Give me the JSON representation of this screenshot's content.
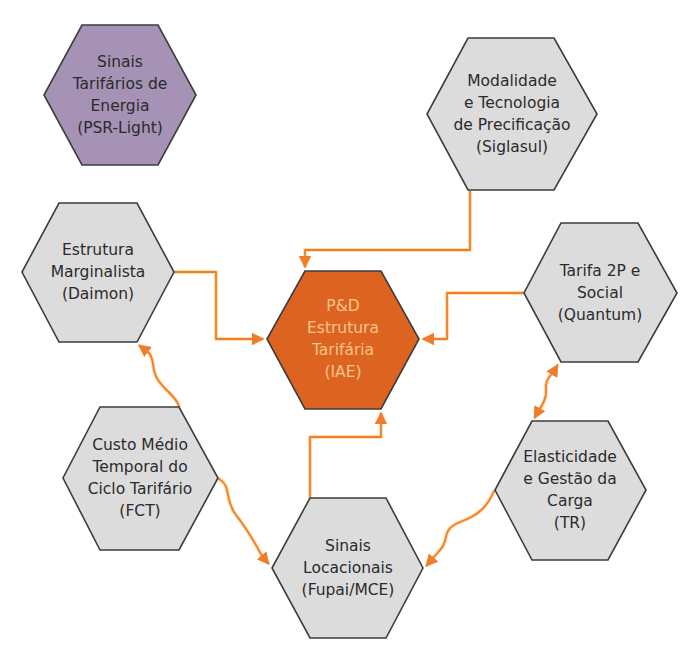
{
  "colors": {
    "background": "#ffffff",
    "hex_gray_fill": "#dcdcdc",
    "hex_purple_fill": "#a592b5",
    "hex_center_fill": "#dd6420",
    "hex_stroke": "#3c3c3c",
    "text_dark": "#2b2b2b",
    "text_center": "#f8c48e",
    "connector": "#ef7d2b",
    "connector_glow": "#f9c46a"
  },
  "nodes": [
    {
      "id": "psr-light",
      "style": "purple",
      "lines": [
        "Sinais",
        "Tarifários de",
        "Energia",
        "(PSR-Light)"
      ],
      "points": "82,25 158,25 196,95 158,165 82,165 44,95",
      "cx": 120,
      "cy": 95
    },
    {
      "id": "siglasul",
      "style": "gray",
      "lines": [
        "Modalidade",
        "e Tecnologia",
        "de Precificação",
        "(Siglasul)"
      ],
      "points": "468,38 554,38 597,114 554,190 468,190 427,114",
      "cx": 512,
      "cy": 114
    },
    {
      "id": "daimon",
      "style": "gray",
      "lines": [
        "Estrutura",
        "Marginalista",
        "(Daimon)"
      ],
      "points": "59,203 137,203 174,272 137,342 59,342 22,272",
      "cx": 98,
      "cy": 272
    },
    {
      "id": "iae",
      "style": "center",
      "lines": [
        "P&D",
        "Estrutura",
        "Tarifária",
        "(IAE)"
      ],
      "points": "305,271 381,271 419,339 381,409 305,409 267,339",
      "cx": 343,
      "cy": 339
    },
    {
      "id": "quantum",
      "style": "gray",
      "lines": [
        "Tarifa 2P e",
        "Social",
        "(Quantum)"
      ],
      "points": "561,223 638,223 677,293 638,362 561,362 524,293",
      "cx": 600,
      "cy": 293
    },
    {
      "id": "fct",
      "style": "gray",
      "lines": [
        "Custo Médio",
        "Temporal do",
        "Ciclo Tarifário",
        "(FCT)"
      ],
      "points": "100,407 179,407 218,478 179,550 100,550 63,478",
      "cx": 140,
      "cy": 478
    },
    {
      "id": "tr",
      "style": "gray",
      "lines": [
        "Elasticidade",
        "e Gestão da",
        "Carga",
        "(TR)"
      ],
      "points": "532,421 608,421 646,490 608,560 532,560 495,490",
      "cx": 570,
      "cy": 490
    },
    {
      "id": "fupai-mce",
      "style": "gray",
      "lines": [
        "Sinais",
        "Locacionais",
        "(Fupai/MCE)"
      ],
      "points": "310,498 386,498 423,568 386,638 310,638 272,568",
      "cx": 348,
      "cy": 568
    }
  ],
  "connectors": [
    {
      "from": "siglasul",
      "to": "iae",
      "type": "elbow",
      "path": "M470,191 L470,250 L305,250 L305,266",
      "arrow_end": true,
      "arrow_start": false
    },
    {
      "from": "daimon",
      "to": "iae",
      "type": "elbow",
      "path": "M175,272 L216,272 L216,339 L262,339",
      "arrow_end": true,
      "arrow_start": false
    },
    {
      "from": "quantum",
      "to": "iae",
      "type": "elbow",
      "path": "M523,293 L447,293 L447,339 L424,339",
      "arrow_end": true,
      "arrow_start": false
    },
    {
      "from": "fupai-mce",
      "to": "iae",
      "type": "elbow",
      "path": "M310,497 L310,437 L381,437 L381,414",
      "arrow_end": true,
      "arrow_start": false
    },
    {
      "from": "fct",
      "to": "daimon",
      "type": "wavy",
      "path": "M179,406 C175,395 166,392 158,380 C150,368 156,360 148,352 L140,346",
      "arrow_end": true,
      "arrow_start": false
    },
    {
      "from": "fct",
      "to": "fupai-mce",
      "type": "wavy",
      "path": "M219,479 C232,486 224,500 236,515 C248,530 256,545 262,556 L268,563",
      "arrow_end": true,
      "arrow_start": false
    },
    {
      "from": "tr",
      "to": "fupai-mce",
      "type": "wavy",
      "path": "M494,491 C488,505 480,515 460,522 C440,530 450,540 440,550 L427,565",
      "arrow_end": true,
      "arrow_start": false
    },
    {
      "from": "quantum",
      "to": "tr",
      "type": "wavy-double",
      "path": "M557,366 C550,378 545,378 546,390 C547,400 540,408 535,417",
      "arrow_end": true,
      "arrow_start": true
    }
  ]
}
